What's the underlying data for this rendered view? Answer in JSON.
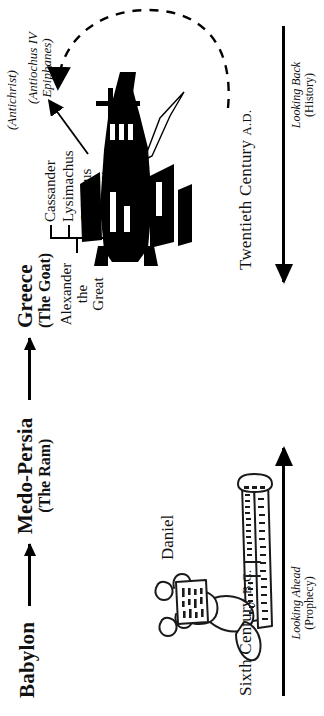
{
  "diagram": {
    "title_sequence": [
      {
        "name": "Babylon",
        "sub": ""
      },
      {
        "name": "Medo-Persia",
        "sub": "(The Ram)"
      },
      {
        "name": "Greece",
        "sub": "(The Goat)"
      }
    ],
    "alexander": {
      "line1": "Alexander",
      "line2": "the",
      "line3": "Great"
    },
    "generals": [
      "Cassander",
      "Lysimachus",
      "Seleucus",
      "Ptolemy"
    ],
    "antiochus_note": {
      "line1": "(Antiochus IV",
      "line2": "Epiphanes)"
    },
    "antichrist_note": "(Antichrist)",
    "daniel_label": "Daniel",
    "left_timeline": {
      "century": "Sixth Century",
      "era": "B.C.",
      "caption_italic": "Looking Ahead",
      "caption_plain": "(Prophecy)"
    },
    "right_timeline": {
      "century": "Twentieth Century",
      "era": "A.D.",
      "caption_italic": "Looking Back",
      "caption_plain": "(History)"
    },
    "icons": {
      "daniel": "daniel-with-scroll-illustration",
      "jet": "fighter-jet-silhouette",
      "cross": "christian-cross",
      "arc": "dashed-loop-arrow"
    },
    "colors": {
      "ink": "#000000",
      "paper": "#ffffff"
    }
  }
}
